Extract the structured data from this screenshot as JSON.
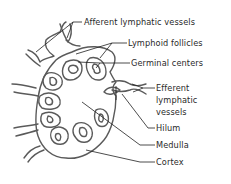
{
  "diagram": {
    "labels": {
      "afferent": "Afferent lymphatic vessels",
      "follicles": "Lymphoid follicles",
      "germinal": "Germinal centers",
      "efferent_1": "Efferent",
      "efferent_2": "lymphatic",
      "efferent_3": "vessels",
      "hilum": "Hilum",
      "medulla": "Medulla",
      "cortex": "Cortex"
    },
    "colors": {
      "structure_stroke": "#5a5a5a",
      "leader_line": "#1f1f1f",
      "text": "#2a2a2a",
      "background": "#ffffff"
    }
  }
}
